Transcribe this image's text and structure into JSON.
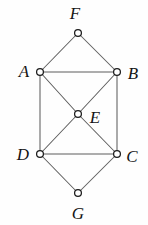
{
  "figure": {
    "kind": "undirected-graph-diagram",
    "background_color": "#fefefe",
    "edge_color": "#5d5d5d",
    "vertex_fill_color": "#ffffff",
    "vertex_stroke_color": "#1b1b1b",
    "label_color": "#141414",
    "vertex_radius": 3.4,
    "width": 148,
    "height": 225
  },
  "vertices": [
    {
      "id": "F",
      "label": "F",
      "cx": 78,
      "cy": 33,
      "label_x": 75,
      "label_y": 13
    },
    {
      "id": "A",
      "label": "A",
      "cx": 40,
      "cy": 72,
      "label_x": 24,
      "label_y": 71
    },
    {
      "id": "B",
      "label": "B",
      "cx": 117,
      "cy": 72,
      "label_x": 133,
      "label_y": 73
    },
    {
      "id": "E",
      "label": "E",
      "cx": 78,
      "cy": 114,
      "label_x": 95,
      "label_y": 117
    },
    {
      "id": "D",
      "label": "D",
      "cx": 40,
      "cy": 154,
      "label_x": 23,
      "label_y": 154
    },
    {
      "id": "C",
      "label": "C",
      "cx": 117,
      "cy": 154,
      "label_x": 132,
      "label_y": 156
    },
    {
      "id": "G",
      "label": "G",
      "cx": 78,
      "cy": 193,
      "label_x": 78,
      "label_y": 213
    }
  ],
  "edges": [
    {
      "from": "F",
      "to": "A"
    },
    {
      "from": "F",
      "to": "B"
    },
    {
      "from": "A",
      "to": "B"
    },
    {
      "from": "A",
      "to": "D"
    },
    {
      "from": "B",
      "to": "C"
    },
    {
      "from": "D",
      "to": "C"
    },
    {
      "from": "A",
      "to": "E"
    },
    {
      "from": "B",
      "to": "E"
    },
    {
      "from": "D",
      "to": "E"
    },
    {
      "from": "C",
      "to": "E"
    },
    {
      "from": "D",
      "to": "G"
    },
    {
      "from": "C",
      "to": "G"
    }
  ]
}
